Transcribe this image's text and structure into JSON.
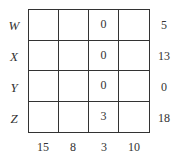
{
  "rows": [
    {
      "label": "W",
      "cells": [
        "",
        "",
        "0",
        ""
      ],
      "total": "5"
    },
    {
      "label": "X",
      "cells": [
        "",
        "",
        "0",
        ""
      ],
      "total": "13"
    },
    {
      "label": "Y",
      "cells": [
        "",
        "",
        "0",
        ""
      ],
      "total": "0"
    },
    {
      "label": "Z",
      "cells": [
        "",
        "",
        "3",
        ""
      ],
      "total": "18"
    }
  ],
  "column_totals": [
    "15",
    "8",
    "3",
    "10"
  ]
}
